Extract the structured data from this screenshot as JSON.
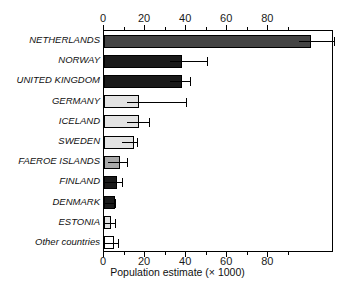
{
  "chart_data": {
    "type": "bar",
    "orientation": "horizontal",
    "title": "",
    "xlabel": "Population estimate (× 1000)",
    "ylabel": "",
    "xlim": [
      0,
      112
    ],
    "xticks": [
      0,
      20,
      40,
      60,
      80
    ],
    "xticklabels": [
      "0",
      "20",
      "40",
      "60",
      "80"
    ],
    "minor_ticks": [
      10,
      30,
      50,
      70,
      90
    ],
    "grid": false,
    "legend": null,
    "axis_top": true,
    "axis_bottom": true,
    "categories": [
      "NETHERLANDS",
      "NORWAY",
      "UNITED KINGDOM",
      "GERMANY",
      "ICELAND",
      "SWEDEN",
      "FAEROE ISLANDS",
      "FINLAND",
      "DENMARK",
      "ESTONIA",
      "Other countries"
    ],
    "values": [
      101,
      38,
      38,
      17,
      17,
      14.5,
      8,
      6.5,
      5.5,
      3.5,
      5
    ],
    "errors_upper": [
      112,
      50,
      42,
      40,
      22,
      16,
      11,
      9,
      5.5,
      5.5,
      7
    ],
    "bar_colors": [
      "#444444",
      "#1a1a1a",
      "#1a1a1a",
      "#e3e3e3",
      "#e3e3e3",
      "#e3e3e3",
      "#a9a9a9",
      "#1a1a1a",
      "#1a1a1a",
      "#e3e3e3",
      "#ffffff"
    ],
    "bars": [
      {
        "label": "NETHERLANDS",
        "value": 101,
        "error_upper": 112,
        "color": "#444444",
        "italic": true
      },
      {
        "label": "NORWAY",
        "value": 38,
        "error_upper": 50,
        "color": "#1a1a1a",
        "italic": true
      },
      {
        "label": "UNITED KINGDOM",
        "value": 38,
        "error_upper": 42,
        "color": "#1a1a1a",
        "italic": true
      },
      {
        "label": "GERMANY",
        "value": 17,
        "error_upper": 40,
        "color": "#e3e3e3",
        "italic": true
      },
      {
        "label": "ICELAND",
        "value": 17,
        "error_upper": 22,
        "color": "#e3e3e3",
        "italic": true
      },
      {
        "label": "SWEDEN",
        "value": 14.5,
        "error_upper": 16,
        "color": "#e3e3e3",
        "italic": true
      },
      {
        "label": "FAEROE ISLANDS",
        "value": 8,
        "error_upper": 11,
        "color": "#a9a9a9",
        "italic": true
      },
      {
        "label": "FINLAND",
        "value": 6.5,
        "error_upper": 9,
        "color": "#1a1a1a",
        "italic": true
      },
      {
        "label": "DENMARK",
        "value": 5.5,
        "error_upper": 5.5,
        "color": "#1a1a1a",
        "italic": true
      },
      {
        "label": "ESTONIA",
        "value": 3.5,
        "error_upper": 5.5,
        "color": "#e3e3e3",
        "italic": true
      },
      {
        "label": "Other countries",
        "value": 5,
        "error_upper": 7,
        "color": "#ffffff",
        "italic": true
      }
    ]
  }
}
